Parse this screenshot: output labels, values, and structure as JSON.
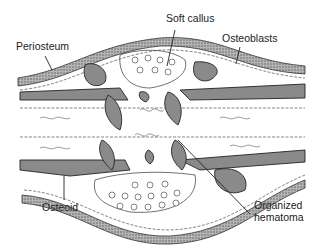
{
  "diagram": {
    "labels": {
      "soft_callus": "Soft callus",
      "periosteum": "Periosteum",
      "osteoblasts": "Osteoblasts",
      "osteoid": "Osteoid",
      "organized_hematoma_line1": "Organized",
      "organized_hematoma_line2": "hematoma"
    },
    "colors": {
      "line": "#222222",
      "bone_fill": "#8a8a8a",
      "periosteum_fill": "#a8a8a8",
      "background": "#ffffff"
    }
  }
}
